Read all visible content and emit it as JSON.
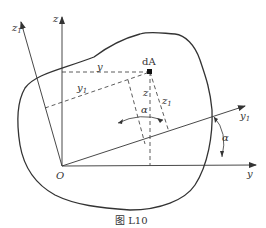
{
  "figure": {
    "caption": "图 L10",
    "colors": {
      "stroke": "#333333",
      "background": "#ffffff"
    }
  },
  "labels": {
    "z": "z",
    "z1_main": "z",
    "z1_sub": "1",
    "y_top": "y",
    "y1_main": "y",
    "y1_sub": "1",
    "dA": "dA",
    "z_inner": "z",
    "z1_inner_main": "z",
    "z1_inner_sub": "1",
    "alpha_inner": "α",
    "alpha_outer": "α",
    "y1_axis_main": "y",
    "y1_axis_sub": "1",
    "y_axis": "y",
    "origin": "O"
  }
}
